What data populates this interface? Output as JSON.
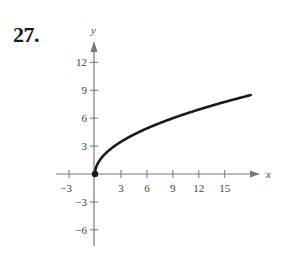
{
  "problem_number": "27.",
  "chart_data": {
    "type": "line",
    "title": "",
    "xlabel": "x",
    "ylabel": "y",
    "function": "y = 2*sqrt(x)",
    "x_ticks": [
      -3,
      3,
      6,
      9,
      12,
      15
    ],
    "y_ticks": [
      12,
      9,
      6,
      3,
      -3,
      -6
    ],
    "xlim": [
      -4.5,
      19
    ],
    "ylim": [
      -7.5,
      14
    ],
    "grid": false,
    "series": [
      {
        "name": "curve",
        "x": [
          0,
          0.25,
          1,
          2,
          3,
          4,
          6,
          8,
          9,
          12,
          15,
          18
        ],
        "y": [
          0,
          1,
          2,
          2.83,
          3.46,
          4,
          4.9,
          5.66,
          6,
          6.93,
          7.75,
          8.49
        ]
      }
    ],
    "endpoint": {
      "x": 0,
      "y": 0,
      "filled": true
    },
    "colors": {
      "axis": "#777777",
      "curve": "#1a1a1a",
      "text": "#444444"
    }
  }
}
